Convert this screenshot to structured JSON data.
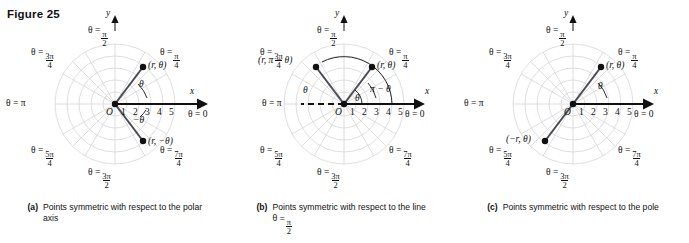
{
  "figure": {
    "title": "Figure 25"
  },
  "common": {
    "axis_ticks": [
      "O",
      "1",
      "2",
      "3",
      "4",
      "5"
    ],
    "y_axis_label": "y",
    "x_axis_label": "x",
    "theta_zero_label": "θ = 0",
    "theta_pi_label": "θ = π",
    "theta_symbol": "θ",
    "angle_labels": [
      {
        "name": "pi-over-2",
        "prefix": "θ =",
        "num": "π",
        "den": "2"
      },
      {
        "name": "pi-over-4",
        "prefix": "θ =",
        "num": "π",
        "den": "4"
      },
      {
        "name": "3pi-over-4",
        "prefix": "θ =",
        "num": "3π",
        "den": "4"
      },
      {
        "name": "5pi-over-4",
        "prefix": "θ =",
        "num": "5π",
        "den": "4"
      },
      {
        "name": "3pi-over-2",
        "prefix": "θ =",
        "num": "3π",
        "den": "2"
      },
      {
        "name": "7pi-over-4",
        "prefix": "θ =",
        "num": "7π",
        "den": "4"
      }
    ],
    "grid_color": "#d6d6d6",
    "axis_color": "#111111",
    "ray_color": "#4a4a55"
  },
  "panels": [
    {
      "id": "a",
      "tag": "(a)",
      "caption_line1": "Points symmetric with",
      "caption_line2": "respect to the polar axis",
      "points": [
        {
          "name": "point-r-theta",
          "label": "(r, θ)"
        },
        {
          "name": "point-r-neg-theta",
          "label": "(r, −θ)"
        }
      ],
      "arc_labels": [
        {
          "name": "arc-theta",
          "label": "θ"
        },
        {
          "name": "arc-neg-theta",
          "label": "−θ"
        }
      ]
    },
    {
      "id": "b",
      "tag": "(b)",
      "caption_line1": "Points symmetric with",
      "caption_line2": "respect to the line θ =",
      "caption_frac_num": "π",
      "caption_frac_den": "2",
      "points": [
        {
          "name": "point-r-pi-minus-theta",
          "label": "(r, π − θ)"
        },
        {
          "name": "point-r-theta",
          "label": "(r, θ)"
        }
      ],
      "arc_labels": [
        {
          "name": "arc-theta",
          "label": "θ"
        },
        {
          "name": "arc-pi-minus-theta",
          "label": "π − θ"
        },
        {
          "name": "arc-inner-theta",
          "label": "θ"
        }
      ]
    },
    {
      "id": "c",
      "tag": "(c)",
      "caption_line1": "Points symmetric with",
      "caption_line2": "respect to the pole",
      "points": [
        {
          "name": "point-r-theta",
          "label": "(r, θ)"
        },
        {
          "name": "point-neg-r-theta",
          "label": "(−r, θ)"
        }
      ],
      "arc_labels": [
        {
          "name": "arc-theta",
          "label": "θ"
        }
      ]
    }
  ]
}
